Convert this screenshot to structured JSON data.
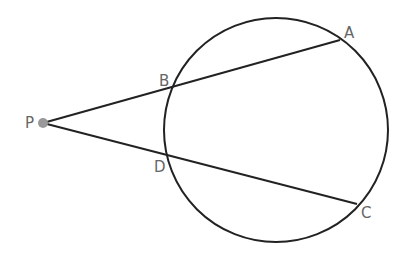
{
  "diagram": {
    "type": "geometry-secants",
    "circle": {
      "cx": 276,
      "cy": 130,
      "r": 112,
      "stroke": "#222222"
    },
    "points": {
      "P": {
        "x": 43,
        "y": 123,
        "label": "P"
      },
      "A": {
        "x": 340,
        "y": 40,
        "label": "A"
      },
      "B": {
        "x": 175,
        "y": 87,
        "label": "B"
      },
      "C": {
        "x": 357,
        "y": 204,
        "label": "C"
      },
      "D": {
        "x": 169,
        "y": 156,
        "label": "D"
      }
    },
    "segments": [
      [
        "P",
        "A"
      ],
      [
        "P",
        "C"
      ]
    ],
    "point_color": "#999999"
  }
}
